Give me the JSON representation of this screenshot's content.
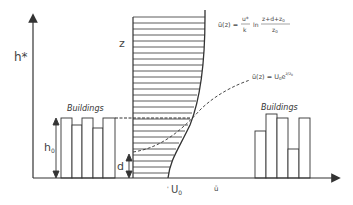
{
  "diagram": {
    "axes": {
      "y_label": "h*",
      "x_label": "ū"
    },
    "labels": {
      "z": "z",
      "buildings_left": "Buildings",
      "buildings_right": "Buildings",
      "h0": "h",
      "h0_sub": "0",
      "d": "d",
      "u0": "U",
      "u0_sub": "0"
    },
    "equations": {
      "log_law": {
        "lhs": "ū(z) =",
        "numerator_left": "u*",
        "denominator_left": "k",
        "ln": "ln",
        "numerator_right": "z+d+z",
        "numerator_right_sub": "0",
        "denominator_right": "z",
        "denominator_right_sub": "0"
      },
      "exponential": {
        "lhs": "ū(z) = U",
        "sub": "0",
        "e": "e",
        "exponent": "z/z",
        "exponent_sub": "0"
      }
    },
    "colors": {
      "line": "#333333",
      "text": "#444444"
    }
  }
}
